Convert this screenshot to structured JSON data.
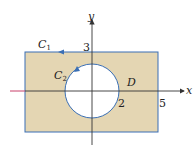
{
  "diagram": {
    "colors": {
      "region_fill": "#e4d6b3",
      "boundary": "#3a6fb5",
      "axis": "#333333",
      "negative_x_axis": "#c8406a"
    },
    "axes": {
      "x_label": "x",
      "y_label": "y"
    },
    "labels": {
      "outer_curve": "C",
      "outer_sub": "1",
      "inner_curve": "C",
      "inner_sub": "2",
      "region": "D",
      "tick_y": "3",
      "tick_radius": "2",
      "tick_x": "5"
    }
  }
}
